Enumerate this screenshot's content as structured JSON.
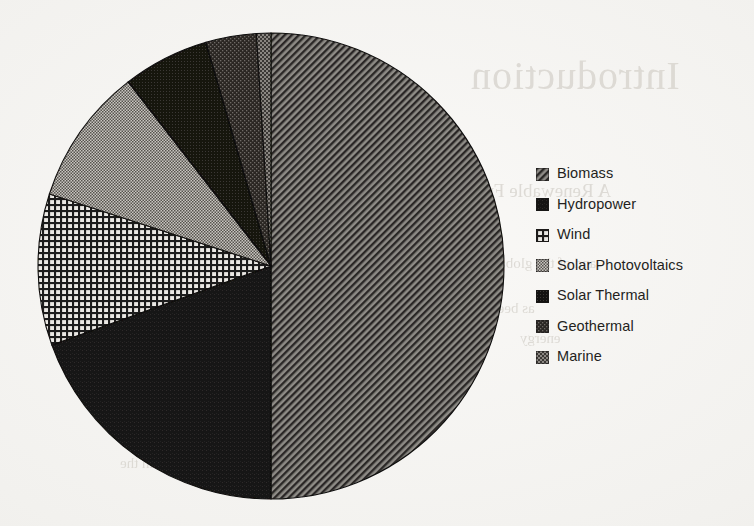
{
  "background_text": {
    "title": "Introduction",
    "subtitle": "A Renewable Future",
    "line1": "and of the global",
    "line2": "as been the",
    "line3": "energy",
    "line4": "the world's",
    "line5": "of all renewable",
    "line6": "with the"
  },
  "legend": {
    "items": [
      {
        "label": "Biomass",
        "pattern": "diagonal-hatch",
        "color": "#4a4744"
      },
      {
        "label": "Hydropower",
        "pattern": "solid-dark",
        "color": "#1c1a19"
      },
      {
        "label": "Wind",
        "pattern": "grid",
        "color": "#3c3936"
      },
      {
        "label": "Solar Photovoltaics",
        "pattern": "fine-checker",
        "color": "#8d8a85"
      },
      {
        "label": "Solar Thermal",
        "pattern": "solid-darkest",
        "color": "#232120"
      },
      {
        "label": "Geothermal",
        "pattern": "dense-noise",
        "color": "#35322f"
      },
      {
        "label": "Marine",
        "pattern": "medium-checker",
        "color": "#46433f"
      }
    ]
  },
  "chart_data": {
    "type": "pie",
    "title": "",
    "legend_position": "right",
    "start_angle_deg": 0,
    "direction": "clockwise",
    "center_px": {
      "x": 271,
      "y": 266
    },
    "radius_px": 233,
    "categories": [
      "Biomass",
      "Hydropower",
      "Wind",
      "Solar Photovoltaics",
      "Solar Thermal",
      "Geothermal",
      "Marine"
    ],
    "values": [
      50.0,
      19.5,
      10.5,
      9.5,
      6.0,
      3.5,
      1.0
    ],
    "unit": "percent",
    "slices": [
      {
        "name": "Biomass",
        "value": 50.0,
        "start_deg": 0,
        "end_deg": 180.0,
        "fill": "#4a4744",
        "pattern": "diagonal-hatch"
      },
      {
        "name": "Hydropower",
        "value": 19.5,
        "start_deg": 180.0,
        "end_deg": 250.2,
        "fill": "#1c1a19",
        "pattern": "solid-dark"
      },
      {
        "name": "Wind",
        "value": 10.5,
        "start_deg": 250.2,
        "end_deg": 288.0,
        "fill": "#3c3936",
        "pattern": "grid"
      },
      {
        "name": "Solar Photovoltaics",
        "value": 9.5,
        "start_deg": 288.0,
        "end_deg": 322.2,
        "fill": "#8d8a85",
        "pattern": "fine-checker"
      },
      {
        "name": "Solar Thermal",
        "value": 6.0,
        "start_deg": 322.2,
        "end_deg": 343.8,
        "fill": "#232120",
        "pattern": "solid-darkest"
      },
      {
        "name": "Geothermal",
        "value": 3.5,
        "start_deg": 343.8,
        "end_deg": 356.4,
        "fill": "#35322f",
        "pattern": "dense-noise"
      },
      {
        "name": "Marine",
        "value": 1.0,
        "start_deg": 356.4,
        "end_deg": 360.0,
        "fill": "#46433f",
        "pattern": "medium-checker"
      }
    ]
  }
}
